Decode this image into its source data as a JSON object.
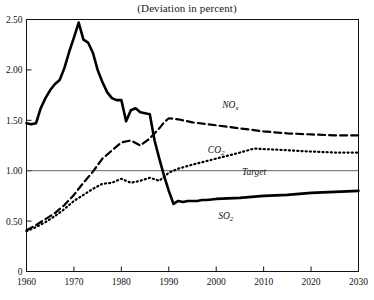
{
  "chart_data": {
    "type": "line",
    "title": "(Deviation in percent)",
    "xlabel": "",
    "ylabel": "",
    "xlim": [
      1960,
      2030
    ],
    "ylim": [
      0,
      2.5
    ],
    "xticks": [
      1960,
      1970,
      1980,
      1990,
      2000,
      2010,
      2020,
      2030
    ],
    "yticks": [
      0,
      0.5,
      1.0,
      1.5,
      2.0,
      2.5
    ],
    "ytick_labels": [
      "0",
      "0.50",
      "1.00",
      "1.50",
      "2.00",
      "2.50"
    ],
    "xtick_labels": [
      "1960",
      "1970",
      "1980",
      "1990",
      "2000",
      "2010",
      "2020",
      "2030"
    ],
    "grid": false,
    "legend": "inline-annotations",
    "reference_line": {
      "label": "Target",
      "value": 1.0,
      "style": "thin-solid"
    },
    "series": [
      {
        "name": "SO2",
        "label": "SO₂",
        "style": "thick-solid",
        "color": "#000000",
        "x": [
          1960,
          1961,
          1962,
          1963,
          1964,
          1965,
          1966,
          1967,
          1968,
          1969,
          1970,
          1971,
          1972,
          1973,
          1974,
          1975,
          1976,
          1977,
          1978,
          1979,
          1980,
          1981,
          1982,
          1983,
          1984,
          1985,
          1986,
          1987,
          1988,
          1989,
          1990,
          1991,
          1992,
          1993,
          1994,
          1995,
          1996,
          1997,
          1998,
          2000,
          2005,
          2010,
          2015,
          2020,
          2025,
          2030
        ],
        "values": [
          1.47,
          1.46,
          1.47,
          1.62,
          1.72,
          1.8,
          1.86,
          1.9,
          2.02,
          2.18,
          2.32,
          2.47,
          2.3,
          2.27,
          2.17,
          2.0,
          1.88,
          1.78,
          1.72,
          1.7,
          1.7,
          1.49,
          1.6,
          1.62,
          1.58,
          1.57,
          1.56,
          1.3,
          1.12,
          0.95,
          0.8,
          0.67,
          0.7,
          0.69,
          0.7,
          0.7,
          0.7,
          0.71,
          0.71,
          0.72,
          0.73,
          0.75,
          0.76,
          0.78,
          0.79,
          0.8
        ]
      },
      {
        "name": "NOx",
        "label": "NOₓ",
        "style": "dashed",
        "color": "#000000",
        "x": [
          1960,
          1962,
          1964,
          1966,
          1968,
          1970,
          1972,
          1974,
          1976,
          1978,
          1980,
          1982,
          1984,
          1986,
          1988,
          1989,
          1990,
          1992,
          1995,
          2000,
          2005,
          2010,
          2015,
          2020,
          2025,
          2030
        ],
        "values": [
          0.41,
          0.46,
          0.52,
          0.58,
          0.66,
          0.76,
          0.88,
          0.99,
          1.12,
          1.2,
          1.28,
          1.3,
          1.25,
          1.32,
          1.42,
          1.48,
          1.52,
          1.51,
          1.48,
          1.45,
          1.42,
          1.39,
          1.37,
          1.36,
          1.35,
          1.35
        ]
      },
      {
        "name": "CO2",
        "label": "CO₂",
        "style": "dotted",
        "color": "#000000",
        "x": [
          1960,
          1962,
          1964,
          1966,
          1968,
          1970,
          1972,
          1974,
          1976,
          1978,
          1980,
          1982,
          1984,
          1986,
          1988,
          1990,
          1992,
          1995,
          2000,
          2005,
          2008,
          2012,
          2016,
          2020,
          2025,
          2030
        ],
        "values": [
          0.4,
          0.44,
          0.49,
          0.55,
          0.62,
          0.7,
          0.76,
          0.82,
          0.87,
          0.88,
          0.92,
          0.88,
          0.9,
          0.93,
          0.9,
          0.98,
          1.02,
          1.06,
          1.12,
          1.18,
          1.22,
          1.21,
          1.2,
          1.19,
          1.18,
          1.18
        ]
      }
    ],
    "annotations": [
      {
        "text": "NOₓ",
        "x": 2003,
        "y": 1.62
      },
      {
        "text": "CO₂",
        "x": 2000,
        "y": 1.18
      },
      {
        "text": "Target",
        "x": 2008,
        "y": 0.96
      },
      {
        "text": "SO₂",
        "x": 2002,
        "y": 0.52
      }
    ]
  }
}
